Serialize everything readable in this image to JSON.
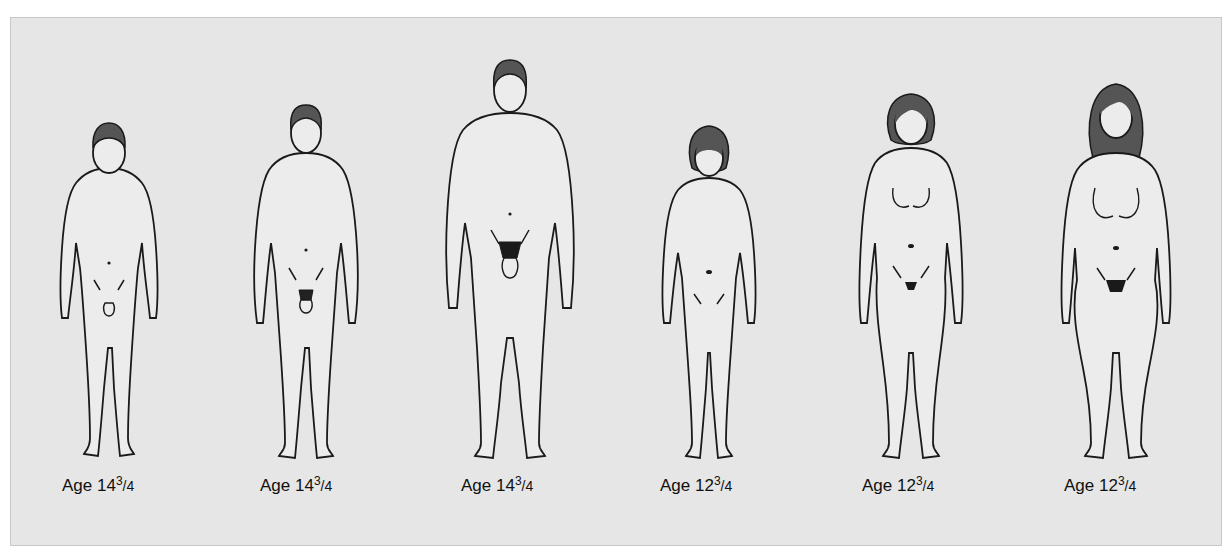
{
  "figure": {
    "figures": [
      {
        "id": "male-1",
        "sex": "male",
        "stage": 1,
        "age_whole": "14",
        "age_num": "3",
        "age_den": "4",
        "label_prefix": "Age"
      },
      {
        "id": "male-2",
        "sex": "male",
        "stage": 2,
        "age_whole": "14",
        "age_num": "3",
        "age_den": "4",
        "label_prefix": "Age"
      },
      {
        "id": "male-3",
        "sex": "male",
        "stage": 3,
        "age_whole": "14",
        "age_num": "3",
        "age_den": "4",
        "label_prefix": "Age"
      },
      {
        "id": "female-1",
        "sex": "female",
        "stage": 1,
        "age_whole": "12",
        "age_num": "3",
        "age_den": "4",
        "label_prefix": "Age"
      },
      {
        "id": "female-2",
        "sex": "female",
        "stage": 2,
        "age_whole": "12",
        "age_num": "3",
        "age_den": "4",
        "label_prefix": "Age"
      },
      {
        "id": "female-3",
        "sex": "female",
        "stage": 3,
        "age_whole": "12",
        "age_num": "3",
        "age_den": "4",
        "label_prefix": "Age"
      }
    ]
  },
  "colors": {
    "panel_bg": "#e6e6e6",
    "outline": "#1a1a1a",
    "hair": "#555555",
    "skin": "#ececec"
  }
}
